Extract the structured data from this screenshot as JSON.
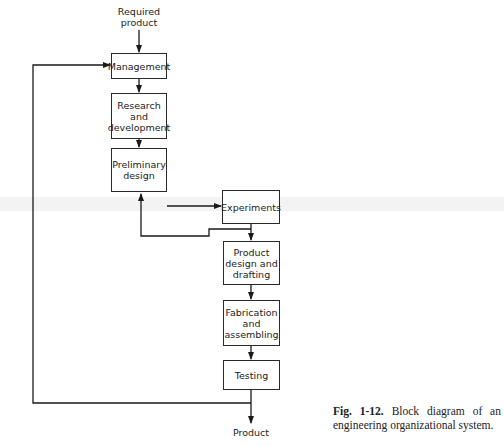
{
  "header_fragment": "operation of systems, and ...",
  "diagram": {
    "input_label": "Required product",
    "output_label": "Product",
    "blocks": [
      {
        "id": "management",
        "label": "Management"
      },
      {
        "id": "research",
        "label": "Research and development"
      },
      {
        "id": "preliminary",
        "label": "Preliminary design"
      },
      {
        "id": "experiments",
        "label": "Experiments"
      },
      {
        "id": "product_design",
        "label": "Product design and drafting"
      },
      {
        "id": "fabrication",
        "label": "Fabrication and assembling"
      },
      {
        "id": "testing",
        "label": "Testing"
      }
    ],
    "edges": [
      [
        "Required product",
        "Management"
      ],
      [
        "Management",
        "Research and development"
      ],
      [
        "Research and development",
        "Preliminary design"
      ],
      [
        "Preliminary design",
        "Experiments"
      ],
      [
        "Experiments",
        "Product design and drafting"
      ],
      [
        "Experiments",
        "Preliminary design"
      ],
      [
        "Product design and drafting",
        "Fabrication and assembling"
      ],
      [
        "Fabrication and assembling",
        "Testing"
      ],
      [
        "Testing",
        "Product"
      ],
      [
        "Testing",
        "Management"
      ]
    ]
  },
  "caption": {
    "fig_number": "Fig. 1-12.",
    "text": "Block diagram of an engineering organizational system."
  }
}
